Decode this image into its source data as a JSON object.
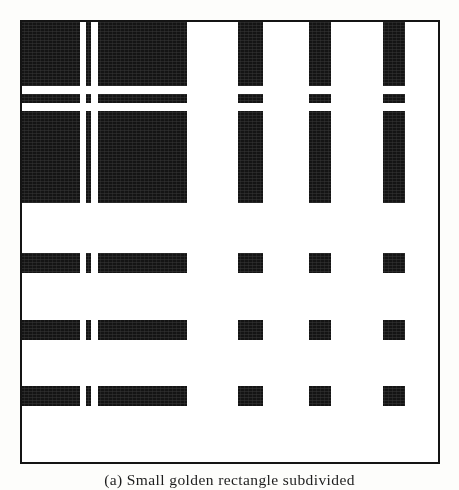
{
  "figure": {
    "label": "(a)",
    "caption": "(a) Small golden rectangle subdivided",
    "caption_full": "(a) Small golden rectangle subdivided",
    "plate_kind": "black-and-white subdivision plate",
    "colors": {
      "ink": "#141414",
      "paper": "#ffffff",
      "page": "#fdfdfb"
    },
    "border": {
      "color": "#141414",
      "width_px": 2
    }
  },
  "chart_data": {
    "type": "heatmap",
    "title": "(a) Small golden rectangle subdivided",
    "xlabel": "",
    "ylabel": "",
    "grid": false,
    "legend": null,
    "value_map": {
      "1": "#141414",
      "0": "#ffffff"
    },
    "columns": [
      {
        "index": 0,
        "x": 0,
        "w": 60,
        "bit": 1
      },
      {
        "index": 1,
        "x": 60,
        "w": 6,
        "bit": 0
      },
      {
        "index": 2,
        "x": 66,
        "w": 5,
        "bit": 1
      },
      {
        "index": 3,
        "x": 71,
        "w": 7,
        "bit": 0
      },
      {
        "index": 4,
        "x": 78,
        "w": 89,
        "bit": 1
      },
      {
        "index": 5,
        "x": 167,
        "w": 51,
        "bit": 0
      },
      {
        "index": 6,
        "x": 218,
        "w": 25,
        "bit": 1
      },
      {
        "index": 7,
        "x": 243,
        "w": 46,
        "bit": 0
      },
      {
        "index": 8,
        "x": 289,
        "w": 22,
        "bit": 1
      },
      {
        "index": 9,
        "x": 311,
        "w": 52,
        "bit": 0
      },
      {
        "index": 10,
        "x": 363,
        "w": 22,
        "bit": 1
      },
      {
        "index": 11,
        "x": 385,
        "w": 35,
        "bit": 0
      }
    ],
    "rows": [
      {
        "index": 0,
        "y": 0,
        "h": 66,
        "bit": 1
      },
      {
        "index": 1,
        "y": 66,
        "h": 8,
        "bit": 0
      },
      {
        "index": 2,
        "y": 74,
        "h": 9,
        "bit": 1
      },
      {
        "index": 3,
        "y": 83,
        "h": 8,
        "bit": 0
      },
      {
        "index": 4,
        "y": 91,
        "h": 92,
        "bit": 1
      },
      {
        "index": 5,
        "y": 183,
        "h": 50,
        "bit": 0
      },
      {
        "index": 6,
        "y": 233,
        "h": 20,
        "bit": 1
      },
      {
        "index": 7,
        "y": 253,
        "h": 47,
        "bit": 0
      },
      {
        "index": 8,
        "y": 300,
        "h": 20,
        "bit": 1
      },
      {
        "index": 9,
        "y": 320,
        "h": 46,
        "bit": 0
      },
      {
        "index": 10,
        "y": 366,
        "h": 20,
        "bit": 1
      },
      {
        "index": 11,
        "y": 386,
        "h": 58,
        "bit": 0
      }
    ],
    "cell_rule": "ink = row.bit AND column.bit",
    "n_columns": 12,
    "n_rows": 12,
    "plate_px": {
      "x": 20,
      "y": 20,
      "w": 420,
      "h": 444
    }
  }
}
